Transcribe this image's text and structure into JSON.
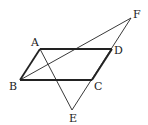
{
  "diagram": {
    "type": "geometry",
    "points": {
      "A": {
        "label": "A",
        "x": 40,
        "y": 49
      },
      "B": {
        "label": "B",
        "x": 20,
        "y": 80
      },
      "C": {
        "label": "C",
        "x": 92,
        "y": 80
      },
      "D": {
        "label": "D",
        "x": 112,
        "y": 49
      },
      "E": {
        "label": "E",
        "x": 72,
        "y": 110
      },
      "F": {
        "label": "F",
        "x": 131,
        "y": 18
      }
    },
    "segments": [
      {
        "from": "A",
        "to": "D",
        "weight": "bold"
      },
      {
        "from": "B",
        "to": "C",
        "weight": "bold"
      },
      {
        "from": "A",
        "to": "B",
        "weight": "bold"
      },
      {
        "from": "D",
        "to": "C",
        "weight": "bold"
      },
      {
        "from": "B",
        "to": "F",
        "weight": "thin"
      },
      {
        "from": "F",
        "to": "E",
        "weight": "thin"
      },
      {
        "from": "A",
        "to": "E",
        "weight": "thin"
      }
    ],
    "colors": {
      "stroke": "#222222",
      "background": "#ffffff"
    }
  }
}
